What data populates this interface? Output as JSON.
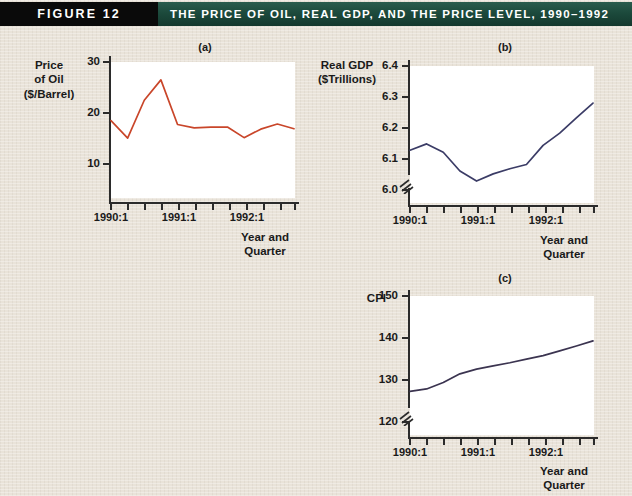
{
  "banner": {
    "figure_label": "FIGURE 12",
    "title": "THE PRICE OF OIL, REAL GDP, AND THE PRICE LEVEL, 1990–1992",
    "black_block_color": "#0a0a0a",
    "green_color": "#1e4d3f",
    "text_color": "#ffffff"
  },
  "page": {
    "background_color": "#e9e3d9"
  },
  "panels": {
    "a": {
      "letter": "(a)",
      "y_axis_title_lines": [
        "Price",
        "of Oil",
        "($/Barrel)"
      ],
      "x_axis_title_lines": [
        "Year and",
        "Quarter"
      ],
      "y_ticks": [
        "30",
        "20",
        "10"
      ],
      "x_ticks": [
        "1990:1",
        "1991:1",
        "1992:1"
      ]
    },
    "b": {
      "letter": "(b)",
      "y_axis_title_lines": [
        "Real GDP",
        "($Trillions)"
      ],
      "x_axis_title_lines": [
        "Year and",
        "Quarter"
      ],
      "y_ticks": [
        "6.4",
        "6.3",
        "6.2",
        "6.1",
        "6.0"
      ],
      "x_ticks": [
        "1990:1",
        "1991:1",
        "1992:1"
      ]
    },
    "c": {
      "letter": "(c)",
      "y_axis_title_lines": [
        "CPI"
      ],
      "x_axis_title_lines": [
        "Year and",
        "Quarter"
      ],
      "y_ticks": [
        "150",
        "140",
        "130",
        "120"
      ],
      "x_ticks": [
        "1990:1",
        "1991:1",
        "1992:1"
      ]
    }
  },
  "chart_data": [
    {
      "id": "a",
      "type": "line",
      "title": "(a)",
      "xlabel": "Year and Quarter",
      "ylabel": "Price of Oil ($/Barrel)",
      "line_color": "#c9462a",
      "ylim": [
        0,
        32
      ],
      "yticks": [
        10,
        20,
        30
      ],
      "grid": false,
      "legend": "none",
      "categories": [
        "1990:1",
        "1990:2",
        "1990:3",
        "1990:4",
        "1991:1",
        "1991:2",
        "1991:3",
        "1991:4",
        "1992:1",
        "1992:2",
        "1992:3",
        "1992:4"
      ],
      "x_tick_labels": {
        "1990:1": "1990:1",
        "1991:1": "1991:1",
        "1992:1": "1992:1"
      },
      "values": [
        18.2,
        14.1,
        23.0,
        27.8,
        17.3,
        16.5,
        16.7,
        16.7,
        14.2,
        16.2,
        17.4,
        16.3
      ]
    },
    {
      "id": "b",
      "type": "line",
      "title": "(b)",
      "xlabel": "Year and Quarter",
      "ylabel": "Real GDP ($Trillions)",
      "line_color": "#3b3c66",
      "ylim": [
        5.97,
        6.45
      ],
      "yticks": [
        6.0,
        6.1,
        6.2,
        6.3,
        6.4
      ],
      "axis_break": true,
      "grid": false,
      "legend": "none",
      "categories": [
        "1990:1",
        "1990:2",
        "1990:3",
        "1990:4",
        "1991:1",
        "1991:2",
        "1991:3",
        "1991:4",
        "1992:1",
        "1992:2",
        "1992:3",
        "1992:4"
      ],
      "x_tick_labels": {
        "1990:1": "1990:1",
        "1991:1": "1991:1",
        "1992:1": "1992:1"
      },
      "values": [
        6.155,
        6.177,
        6.148,
        6.082,
        6.047,
        6.072,
        6.09,
        6.105,
        6.172,
        6.215,
        6.268,
        6.32
      ]
    },
    {
      "id": "c",
      "type": "line",
      "title": "(c)",
      "xlabel": "Year and Quarter",
      "ylabel": "CPI",
      "line_color": "#3b3450",
      "ylim": [
        117,
        152
      ],
      "yticks": [
        120,
        130,
        140,
        150
      ],
      "axis_break": true,
      "grid": false,
      "legend": "none",
      "categories": [
        "1990:1",
        "1990:2",
        "1990:3",
        "1990:4",
        "1991:1",
        "1991:2",
        "1991:3",
        "1991:4",
        "1992:1",
        "1992:2",
        "1992:3",
        "1992:4"
      ],
      "x_tick_labels": {
        "1990:1": "1990:1",
        "1991:1": "1991:1",
        "1992:1": "1992:1"
      },
      "values": [
        128.0,
        128.6,
        130.2,
        132.4,
        133.6,
        134.4,
        135.2,
        136.1,
        137.0,
        138.2,
        139.4,
        140.7
      ]
    }
  ],
  "footnote": ""
}
